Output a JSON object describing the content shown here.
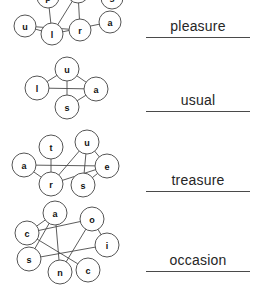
{
  "worksheet": {
    "title": "Word scramble connect-the-letters worksheet",
    "background_color": "#ffffff",
    "ink_color": "#4a4a4a",
    "text_color": "#262626",
    "puzzle_count": 4
  },
  "puzzles": [
    {
      "id": "puzzle-pleasure",
      "index": 1,
      "answer": "pleasure",
      "letters": [
        "u",
        "l",
        "r",
        "a"
      ],
      "all_letters_including_cutoff": [
        "p",
        "e",
        "s",
        "u",
        "l",
        "r",
        "a"
      ],
      "note": "top of letter cluster is cropped off the top edge of the image",
      "nodes": [
        {
          "label": "u",
          "x": 25,
          "y": 26,
          "r": 11
        },
        {
          "label": "l",
          "x": 52,
          "y": 34,
          "r": 11
        },
        {
          "label": "r",
          "x": 80,
          "y": 30,
          "r": 11
        },
        {
          "label": "a",
          "x": 110,
          "y": 22,
          "r": 11
        },
        {
          "label": "p",
          "x": 48,
          "y": -3,
          "r": 11
        },
        {
          "label": "e",
          "x": 78,
          "y": -8,
          "r": 11
        },
        {
          "label": "s",
          "x": 112,
          "y": -2,
          "r": 11
        }
      ],
      "edges": [
        [
          "u",
          "r"
        ],
        [
          "u",
          "l"
        ],
        [
          "l",
          "p"
        ],
        [
          "l",
          "a"
        ],
        [
          "r",
          "e"
        ],
        [
          "p",
          "e"
        ],
        [
          "e",
          "s"
        ],
        [
          "l",
          "e"
        ]
      ],
      "answer_slot": {
        "x": 146,
        "y": 18,
        "width": 104
      }
    },
    {
      "id": "puzzle-usual",
      "index": 2,
      "answer": "usual",
      "letters": [
        "l",
        "u",
        "a",
        "s"
      ],
      "nodes": [
        {
          "label": "u",
          "x": 67,
          "y": 69,
          "r": 12
        },
        {
          "label": "l",
          "x": 37,
          "y": 88,
          "r": 12
        },
        {
          "label": "a",
          "x": 96,
          "y": 89,
          "r": 12
        },
        {
          "label": "s",
          "x": 67,
          "y": 107,
          "r": 12
        }
      ],
      "edges": [
        [
          "l",
          "a"
        ],
        [
          "u",
          "s"
        ],
        [
          "u",
          "a"
        ],
        [
          "a",
          "s"
        ],
        [
          "u",
          "l"
        ]
      ],
      "answer_slot": {
        "x": 146,
        "y": 92,
        "width": 104
      }
    },
    {
      "id": "puzzle-treasure",
      "index": 3,
      "answer": "treasure",
      "letters": [
        "t",
        "u",
        "a",
        "e",
        "r",
        "s"
      ],
      "nodes": [
        {
          "label": "t",
          "x": 51,
          "y": 147,
          "r": 12
        },
        {
          "label": "u",
          "x": 87,
          "y": 142,
          "r": 12
        },
        {
          "label": "a",
          "x": 24,
          "y": 165,
          "r": 12
        },
        {
          "label": "e",
          "x": 107,
          "y": 166,
          "r": 12
        },
        {
          "label": "r",
          "x": 51,
          "y": 184,
          "r": 12
        },
        {
          "label": "s",
          "x": 83,
          "y": 185,
          "r": 12
        }
      ],
      "edges": [
        [
          "a",
          "e"
        ],
        [
          "t",
          "r"
        ],
        [
          "u",
          "r"
        ],
        [
          "u",
          "s"
        ],
        [
          "r",
          "e"
        ],
        [
          "s",
          "e"
        ],
        [
          "a",
          "r"
        ],
        [
          "u",
          "e"
        ]
      ],
      "answer_slot": {
        "x": 146,
        "y": 172,
        "width": 104
      }
    },
    {
      "id": "puzzle-occasion",
      "index": 4,
      "answer": "occasion",
      "letters": [
        "a",
        "o",
        "c",
        "i",
        "s",
        "n",
        "c"
      ],
      "nodes": [
        {
          "label": "a",
          "x": 55,
          "y": 213,
          "r": 12
        },
        {
          "label": "o",
          "x": 92,
          "y": 219,
          "r": 12
        },
        {
          "label": "c",
          "x": 27,
          "y": 233,
          "r": 12
        },
        {
          "label": "i",
          "x": 107,
          "y": 245,
          "r": 12
        },
        {
          "label": "s",
          "x": 29,
          "y": 259,
          "r": 12
        },
        {
          "label": "n",
          "x": 60,
          "y": 272,
          "r": 12
        },
        {
          "label": "c",
          "x": 88,
          "y": 270,
          "r": 12
        }
      ],
      "edges": [
        [
          "c",
          "o"
        ],
        [
          "c",
          "c"
        ],
        [
          "a",
          "n"
        ],
        [
          "a",
          "s"
        ],
        [
          "o",
          "i"
        ],
        [
          "o",
          "n"
        ],
        [
          "s",
          "i"
        ],
        [
          "a",
          "c"
        ]
      ],
      "answer_slot": {
        "x": 146,
        "y": 252,
        "width": 104
      }
    }
  ]
}
